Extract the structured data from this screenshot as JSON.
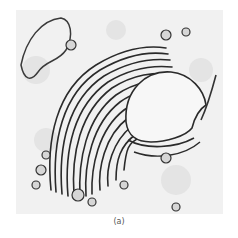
{
  "figure": {
    "caption": "(a)",
    "colors": {
      "background": "#f3f3f3",
      "membrane": "#2a2a2a",
      "vesicle_fill": "#d8d8d8"
    }
  }
}
